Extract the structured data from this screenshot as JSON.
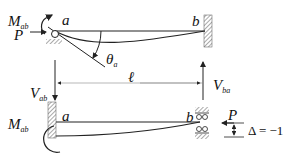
{
  "diagram": {
    "top_beam": {
      "left_node": "a",
      "right_node": "b",
      "moment_label": "M",
      "moment_sub": "ab",
      "force_label": "P",
      "rotation_label": "θ",
      "rotation_sub": "a",
      "left_support": "pin-roller",
      "right_support": "fixed"
    },
    "span": {
      "length_label": "ℓ",
      "left_shear_label": "V",
      "left_shear_sub": "ab",
      "right_shear_label": "V",
      "right_shear_sub": "ba"
    },
    "bottom_beam": {
      "left_node": "a",
      "right_node": "b",
      "moment_label": "M",
      "moment_sub": "ab",
      "force_label": "P",
      "displacement_label": "Δ = −1",
      "left_support": "fixed",
      "right_support": "roller-guided"
    },
    "colors": {
      "line": "#222222",
      "hatch": "#555555",
      "background": "#ffffff"
    }
  }
}
